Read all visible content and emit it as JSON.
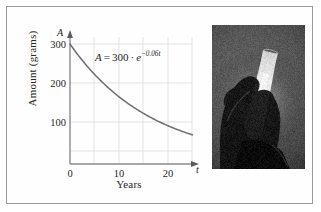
{
  "figure": {
    "caption_present": false,
    "frame_color": "#9a9a9a",
    "background": "#ffffff"
  },
  "chart_data": {
    "type": "line",
    "title": "",
    "xlabel": "Years",
    "ylabel": "Amount (grams)",
    "x_axis_variable": "t",
    "y_axis_variable": "A",
    "xlim": [
      0,
      26
    ],
    "ylim": [
      0,
      340
    ],
    "xticks": [
      0,
      10,
      20
    ],
    "xtick_labels": [
      "0",
      "10",
      "20"
    ],
    "yticks": [
      100,
      200,
      300
    ],
    "ytick_labels": [
      "100",
      "200",
      "300"
    ],
    "grid": true,
    "grid_color": "#d8d8d8",
    "legend": "none",
    "annotation": {
      "text": "A = 300 · e^-0.06t",
      "lhs": "A",
      "equals": "=",
      "coefficient": "300",
      "dot": "·",
      "base": "e",
      "exponent": "−0.06t"
    },
    "series": [
      {
        "name": "A = 300 e^(-0.06t)",
        "color": "#6e6e6e",
        "model": "exponential_decay",
        "initial_value": 300,
        "decay_rate": 0.06,
        "x": [
          0,
          2,
          4,
          6,
          8,
          10,
          12,
          14,
          16,
          18,
          20,
          22,
          24,
          25
        ],
        "values": [
          300,
          266,
          236,
          209,
          186,
          165,
          146,
          129,
          115,
          102,
          90,
          80,
          71,
          67
        ]
      }
    ]
  },
  "labels": {
    "y_axis_title": "Amount (grams)",
    "x_axis_title": "Years",
    "y_axis_var": "A",
    "x_axis_var": "t",
    "ytick_300": "300",
    "ytick_200": "200",
    "ytick_100": "100",
    "xtick_0": "0",
    "xtick_10": "10",
    "xtick_20": "20"
  },
  "equation": {
    "lhs": "A",
    "equals": "=",
    "coefficient": "300",
    "dot": "·",
    "base": "e",
    "exponent": "−0.06t"
  },
  "photo": {
    "description": "hand holding a glowing test tube",
    "alt": "Gloved hand holding an illuminated test tube against a dark background",
    "border_color": "#101010",
    "dominant_tone": "#3a3a3a"
  }
}
